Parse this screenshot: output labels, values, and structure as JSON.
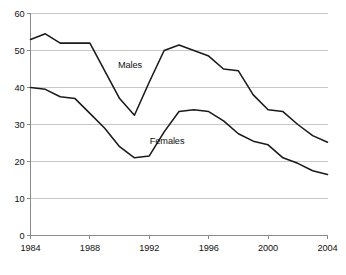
{
  "chart_data": {
    "type": "line",
    "title": "",
    "subtitle": "",
    "xlabel": "",
    "ylabel": "",
    "xlim": [
      1984,
      2004
    ],
    "ylim": [
      0,
      60
    ],
    "y_ticks": [
      0,
      10,
      20,
      30,
      40,
      50,
      60
    ],
    "x_ticks": [
      1984,
      1988,
      1992,
      1996,
      2000,
      2004
    ],
    "x": [
      1984,
      1985,
      1986,
      1987,
      1988,
      1989,
      1990,
      1991,
      1992,
      1993,
      1994,
      1995,
      1996,
      1997,
      1998,
      1999,
      2000,
      2001,
      2002,
      2003,
      2004
    ],
    "grid": "horizontal",
    "legend": "inline-labels",
    "series": [
      {
        "name": "Males",
        "color": "#1a1a1a",
        "label_x": 1990.7,
        "label_y": 46.0,
        "values": [
          53.0,
          54.5,
          52.0,
          52.0,
          52.0,
          44.5,
          37.0,
          32.5,
          41.5,
          50.0,
          51.5,
          50.0,
          48.5,
          45.0,
          44.5,
          38.0,
          34.0,
          33.5,
          30.0,
          27.0,
          25.2
        ]
      },
      {
        "name": "Females",
        "color": "#1a1a1a",
        "label_x": 1993.2,
        "label_y": 25.5,
        "values": [
          40.0,
          39.5,
          37.5,
          37.0,
          33.0,
          29.0,
          24.0,
          21.0,
          21.5,
          28.0,
          33.5,
          34.0,
          33.5,
          31.0,
          27.5,
          25.5,
          24.5,
          21.0,
          19.5,
          17.5,
          16.5
        ]
      }
    ],
    "y_tick_labels": [
      "0",
      "10",
      "20",
      "30",
      "40",
      "50",
      "60"
    ],
    "x_tick_labels": [
      "1984",
      "1988",
      "1992",
      "1996",
      "2000",
      "2004"
    ],
    "series_names": [
      "Males",
      "Females"
    ],
    "colors": {
      "line": "#1a1a1a",
      "gridline": "#c8c8c8",
      "axis": "#8a8a8a",
      "background": "#ffffff",
      "text": "#111111"
    }
  }
}
